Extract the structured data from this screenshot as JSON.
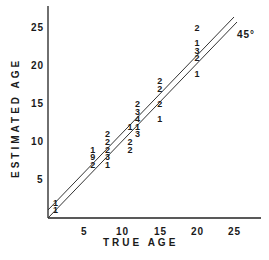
{
  "chart_data": {
    "type": "scatter",
    "title": "",
    "xlabel": "TRUE AGE",
    "ylabel": "ESTIMATED AGE",
    "xlim": [
      0,
      28
    ],
    "ylim": [
      0,
      28
    ],
    "xticks": [
      "5",
      "10",
      "15",
      "20",
      "25"
    ],
    "yticks": [
      "5",
      "10",
      "15",
      "20",
      "25"
    ],
    "grid": false,
    "legend": null,
    "annotations": [
      "45°"
    ],
    "reference_lines": [
      {
        "name": "45-degree line (y = x)",
        "from": [
          0,
          0
        ],
        "to": [
          25,
          25
        ]
      },
      {
        "name": "parallel line (y = x + 1)",
        "from": [
          0,
          1
        ],
        "to": [
          24.5,
          25.5
        ]
      }
    ],
    "points_note": "Each marker is a digit giving the count of specimens at that (true age, estimated age)",
    "points": [
      {
        "x": 1,
        "y": 2,
        "count": 1
      },
      {
        "x": 1,
        "y": 1,
        "count": 1
      },
      {
        "x": 6,
        "y": 9,
        "count": 1
      },
      {
        "x": 6,
        "y": 8,
        "count": 9
      },
      {
        "x": 6,
        "y": 7,
        "count": 2
      },
      {
        "x": 8,
        "y": 11,
        "count": 2
      },
      {
        "x": 8,
        "y": 10,
        "count": 2
      },
      {
        "x": 8,
        "y": 9,
        "count": 2
      },
      {
        "x": 8,
        "y": 8,
        "count": 3
      },
      {
        "x": 8,
        "y": 7,
        "count": 1
      },
      {
        "x": 11,
        "y": 12,
        "count": 1
      },
      {
        "x": 11,
        "y": 10,
        "count": 2
      },
      {
        "x": 11,
        "y": 9,
        "count": 2
      },
      {
        "x": 12,
        "y": 15,
        "count": 2
      },
      {
        "x": 12,
        "y": 14,
        "count": 3
      },
      {
        "x": 12,
        "y": 13,
        "count": 4
      },
      {
        "x": 12,
        "y": 12,
        "count": 1
      },
      {
        "x": 12,
        "y": 11,
        "count": 3
      },
      {
        "x": 15,
        "y": 18,
        "count": 2
      },
      {
        "x": 15,
        "y": 17,
        "count": 2
      },
      {
        "x": 15,
        "y": 15,
        "count": 2
      },
      {
        "x": 15,
        "y": 13,
        "count": 1
      },
      {
        "x": 20,
        "y": 25,
        "count": 2
      },
      {
        "x": 20,
        "y": 23,
        "count": 1
      },
      {
        "x": 20,
        "y": 22,
        "count": 3
      },
      {
        "x": 20,
        "y": 21,
        "count": 2
      },
      {
        "x": 20,
        "y": 19,
        "count": 1
      }
    ]
  },
  "labels": {
    "xlabel": "TRUE AGE",
    "ylabel": "ESTIMATED AGE",
    "angle": "45°",
    "xticks": [
      "5",
      "10",
      "15",
      "20",
      "25"
    ],
    "yticks": [
      "5",
      "10",
      "15",
      "20",
      "25"
    ]
  }
}
